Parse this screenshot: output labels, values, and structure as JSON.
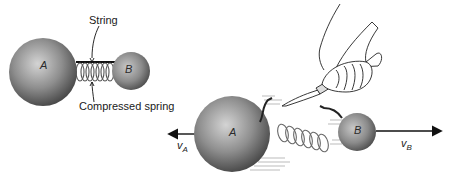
{
  "figure": {
    "before": {
      "ball_a_label": "A",
      "ball_b_label": "B",
      "string_label": "String",
      "spring_label": "Compressed spring"
    },
    "after": {
      "ball_a_label": "A",
      "ball_b_label": "B",
      "velocity_a": {
        "symbol": "v",
        "subscript": "A",
        "direction": "left"
      },
      "velocity_b": {
        "symbol": "v",
        "subscript": "B",
        "direction": "right"
      }
    },
    "colors": {
      "ball_light": "#cfcfcf",
      "ball_mid": "#8a8a8a",
      "ball_dark": "#4a4a4a",
      "line": "#111111",
      "motion_lines": "#bdbdbd"
    }
  }
}
